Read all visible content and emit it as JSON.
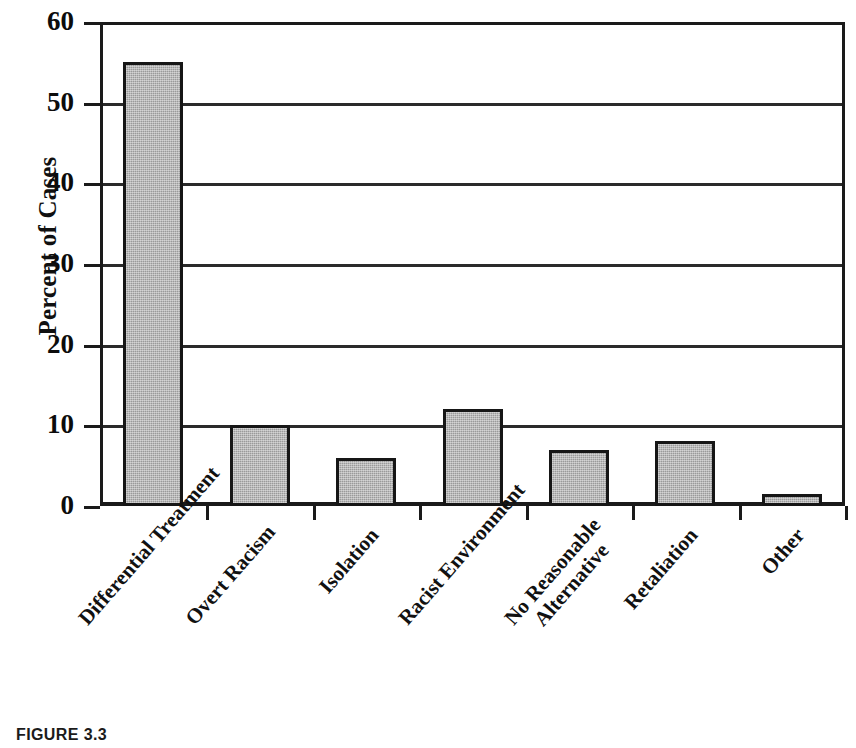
{
  "figure": {
    "caption": "FIGURE 3.3"
  },
  "chart_data": {
    "type": "bar",
    "title": "",
    "subtitle": "",
    "xlabel": "",
    "ylabel": "Percent of Cases",
    "ylim": [
      0,
      60
    ],
    "ytick_interval": 10,
    "ytick_labels": [
      "0",
      "10",
      "20",
      "30",
      "40",
      "50",
      "60"
    ],
    "ytick_values": [
      0,
      10,
      20,
      30,
      40,
      50,
      60
    ],
    "grid": true,
    "grid_axis": "y",
    "legend": false,
    "legend_position": "none",
    "bar_fill_color": "#9a9a9a",
    "bar_edge_color": "#161616",
    "axis_color": "#1a1a1a",
    "background_color": "#ffffff",
    "categories": [
      "Differential Treatment",
      "Overt Racism",
      "Isolation",
      "Racist Environment",
      "No Reasonable Alternative",
      "Retaliation",
      "Other"
    ],
    "category_label_lines": [
      [
        "Differential Treatment"
      ],
      [
        "Overt Racism"
      ],
      [
        "Isolation"
      ],
      [
        "Racist Environment"
      ],
      [
        "No Reasonable",
        "Alternative"
      ],
      [
        "Retaliation"
      ],
      [
        "Other"
      ]
    ],
    "values": [
      55,
      10,
      6,
      12,
      7,
      8,
      1.5
    ],
    "value_unit": "percent",
    "annotations": []
  }
}
